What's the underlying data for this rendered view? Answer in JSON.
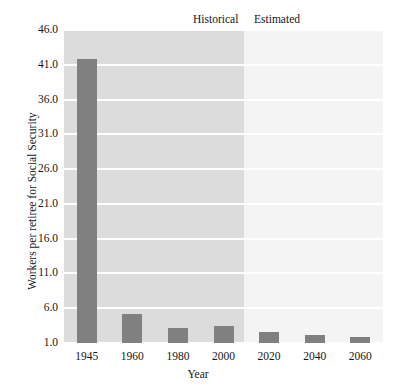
{
  "chart_data": {
    "type": "bar",
    "title": "",
    "xlabel": "Year",
    "ylabel": "Workers per retiree for Social Security",
    "categories": [
      "1945",
      "1960",
      "1980",
      "2000",
      "2020",
      "2040",
      "2060"
    ],
    "values": [
      41.9,
      5.1,
      3.2,
      3.4,
      2.6,
      2.2,
      1.9
    ],
    "ylim": [
      1.0,
      46.0
    ],
    "yticks": [
      "1.0",
      "6.0",
      "11.0",
      "16.0",
      "21.0",
      "26.0",
      "31.0",
      "36.0",
      "41.0",
      "46.0"
    ],
    "ytick_values": [
      1.0,
      6.0,
      11.0,
      16.0,
      21.0,
      26.0,
      31.0,
      36.0,
      41.0,
      46.0
    ],
    "grid": true,
    "legend": "none",
    "annotations": [
      {
        "label": "Historical",
        "region": "1945-2010"
      },
      {
        "label": "Estimated",
        "region": "2010-2070"
      }
    ],
    "colors": {
      "bar": "#808080",
      "historical_band": "#dcdcdc",
      "estimated_band": "#f4f4f4",
      "gridline": "#ffffff",
      "text": "#161616",
      "page_background": "#ffffff"
    }
  },
  "regions": {
    "historical_label": "Historical",
    "estimated_label": "Estimated"
  }
}
